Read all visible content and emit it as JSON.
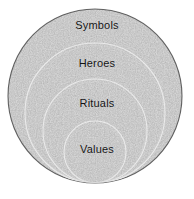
{
  "diagram": {
    "type": "nested-circles",
    "title": "",
    "background_color": "#ffffff",
    "fill_color": "#909090",
    "fill_texture": "gray-noise",
    "arc_color": "#e8e8e8",
    "outline_color": "#4a4a4a",
    "label_color": "#141414",
    "layers": [
      {
        "id": "symbols",
        "label": "Symbols",
        "order": 1,
        "depth": "outermost",
        "cx": 95,
        "cy": 96,
        "rx": 87,
        "ry": 87,
        "label_y": 25
      },
      {
        "id": "heroes",
        "label": "Heroes",
        "order": 2,
        "depth": "second",
        "cx": 95,
        "cy": 113,
        "rx": 70,
        "ry": 70,
        "label_y": 63
      },
      {
        "id": "rituals",
        "label": "Rituals",
        "order": 3,
        "depth": "third",
        "cx": 95,
        "cy": 131,
        "rx": 52,
        "ry": 52,
        "label_y": 103
      },
      {
        "id": "values",
        "label": "Values",
        "order": 4,
        "depth": "innermost",
        "cx": 95,
        "cy": 152,
        "rx": 31,
        "ry": 31,
        "label_y": 149
      }
    ]
  }
}
